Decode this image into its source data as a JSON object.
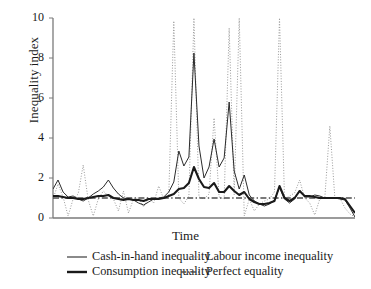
{
  "chart_data": {
    "type": "line",
    "title": "",
    "xlabel": "Time",
    "ylabel": "Inequality index",
    "ylim": [
      0,
      10
    ],
    "yticks": [
      0,
      2,
      4,
      6,
      8,
      10
    ],
    "ytick_labels": [
      "0",
      "2",
      "4",
      "6",
      "8",
      "10"
    ],
    "xticks": [],
    "xtick_labels": [],
    "grid": false,
    "legend_position": "below-axes",
    "n_points": 61,
    "x": [
      0,
      1,
      2,
      3,
      4,
      5,
      6,
      7,
      8,
      9,
      10,
      11,
      12,
      13,
      14,
      15,
      16,
      17,
      18,
      19,
      20,
      21,
      22,
      23,
      24,
      25,
      26,
      27,
      28,
      29,
      30,
      31,
      32,
      33,
      34,
      35,
      36,
      37,
      38,
      39,
      40,
      41,
      42,
      43,
      44,
      45,
      46,
      47,
      48,
      49,
      50,
      51,
      52,
      53,
      54,
      55,
      56,
      57,
      58,
      59,
      60
    ],
    "series": [
      {
        "name": "Cash-in-hand inequality",
        "style": "solid-thin",
        "color": "#2b2b2b",
        "width": 1.0,
        "values": [
          1.45,
          1.9,
          1.3,
          1.05,
          1.1,
          0.95,
          0.85,
          1.0,
          1.2,
          1.35,
          1.55,
          1.9,
          1.5,
          1.2,
          1.0,
          0.95,
          0.9,
          0.75,
          0.65,
          0.8,
          0.95,
          1.0,
          1.05,
          1.3,
          1.8,
          3.35,
          2.6,
          3.05,
          8.25,
          3.6,
          2.0,
          2.55,
          3.95,
          2.55,
          3.0,
          5.8,
          2.35,
          1.45,
          2.15,
          1.15,
          0.85,
          0.7,
          0.6,
          0.7,
          0.9,
          1.55,
          0.95,
          0.75,
          0.95,
          1.4,
          1.05,
          1.05,
          1.15,
          1.1,
          1.0,
          1.0,
          1.0,
          0.95,
          0.9,
          0.5,
          0.05
        ]
      },
      {
        "name": "Consumption inequality",
        "style": "solid-thick",
        "color": "#1a1a1a",
        "width": 2.1,
        "values": [
          1.1,
          1.1,
          1.05,
          1.0,
          1.0,
          0.95,
          0.95,
          1.0,
          1.05,
          1.1,
          1.1,
          1.15,
          1.0,
          0.95,
          0.9,
          0.95,
          0.9,
          0.9,
          0.85,
          0.95,
          0.95,
          0.95,
          1.0,
          1.1,
          1.2,
          1.45,
          1.5,
          1.75,
          2.55,
          1.95,
          1.55,
          1.5,
          1.75,
          1.3,
          1.3,
          1.6,
          1.35,
          1.15,
          1.3,
          0.95,
          0.8,
          0.7,
          0.7,
          0.75,
          0.85,
          1.6,
          1.0,
          0.85,
          1.0,
          1.35,
          1.1,
          1.1,
          1.05,
          1.0,
          1.0,
          1.0,
          1.0,
          1.0,
          0.95,
          0.6,
          0.25
        ]
      },
      {
        "name": "Labour income inequality",
        "style": "dotted",
        "color": "#9a9a9a",
        "width": 1.0,
        "values": [
          0.95,
          1.7,
          1.05,
          0.1,
          0.95,
          1.2,
          2.65,
          0.9,
          0.1,
          0.95,
          1.35,
          1.1,
          0.95,
          0.35,
          1.35,
          0.25,
          0.95,
          1.0,
          0.55,
          1.0,
          0.75,
          1.6,
          0.95,
          1.15,
          9.85,
          1.0,
          0.7,
          1.1,
          10.0,
          1.05,
          0.95,
          1.2,
          5.0,
          1.05,
          0.95,
          9.5,
          1.15,
          10.0,
          0.1,
          0.95,
          0.35,
          0.7,
          0.85,
          0.95,
          1.3,
          10.0,
          0.95,
          1.1,
          1.25,
          1.9,
          1.0,
          0.75,
          0.15,
          0.95,
          1.0,
          4.6,
          1.0,
          1.0,
          0.5,
          0.2,
          0.05
        ]
      },
      {
        "name": "Perfect equality",
        "style": "dash-dot",
        "color": "#4d4d4d",
        "width": 1.4,
        "constant": 1,
        "values": [
          1,
          1,
          1,
          1,
          1,
          1,
          1,
          1,
          1,
          1,
          1,
          1,
          1,
          1,
          1,
          1,
          1,
          1,
          1,
          1,
          1,
          1,
          1,
          1,
          1,
          1,
          1,
          1,
          1,
          1,
          1,
          1,
          1,
          1,
          1,
          1,
          1,
          1,
          1,
          1,
          1,
          1,
          1,
          1,
          1,
          1,
          1,
          1,
          1,
          1,
          1,
          1,
          1,
          1,
          1,
          1,
          1,
          1,
          1,
          1,
          1
        ]
      }
    ]
  },
  "legend": {
    "items": [
      {
        "label": "Cash-in-hand inequality",
        "style": "solid-thin"
      },
      {
        "label": "Labour income inequality",
        "style": "dotted"
      },
      {
        "label": "Consumption inequality",
        "style": "solid-thick"
      },
      {
        "label": "Perfect equality",
        "style": "dash-dot"
      }
    ]
  },
  "axes": {
    "y_title": "Inequality index",
    "x_title": "Time",
    "axis_color": "#7a7a7a"
  }
}
